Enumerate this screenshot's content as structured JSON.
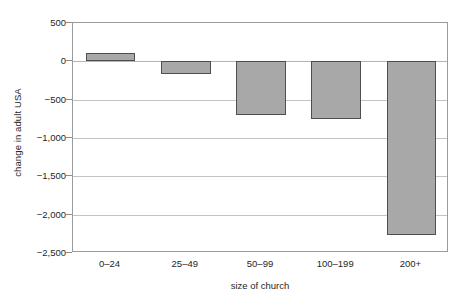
{
  "chart_data": {
    "type": "bar",
    "title": "",
    "subtitle": "",
    "categories": [
      "0–24",
      "25–49",
      "50–99",
      "100–199",
      "200+"
    ],
    "values": [
      110,
      -160,
      -700,
      -750,
      -2260
    ],
    "xlabel": "size of church",
    "ylabel": "change in adult USA",
    "ylim": [
      -2500,
      500
    ],
    "ytick_values": [
      500,
      0,
      -500,
      -1000,
      -1500,
      -2000,
      -2500
    ],
    "ytick_labels": [
      "500",
      "0",
      "−500",
      "−1,000",
      "−1,500",
      "−2,000",
      "−2,500"
    ],
    "grid": "horizontal",
    "legend": "none",
    "bar_fill_color": "#a8a8a8",
    "bar_border_color": "#4f4f4f",
    "gridline_color": "#c4c4c4",
    "frame_color": "#9b9b9b",
    "background_color": "#ffffff"
  }
}
